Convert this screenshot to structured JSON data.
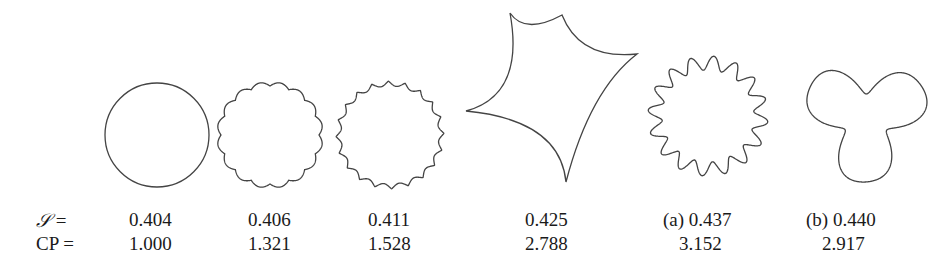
{
  "figure": {
    "row_labels": {
      "s": "S =",
      "cp": "CP ="
    },
    "shapes": [
      {
        "id": "circle",
        "tag": "",
        "s": "0.404",
        "cp": "1.000"
      },
      {
        "id": "scalloped-16",
        "tag": "",
        "s": "0.406",
        "cp": "1.321"
      },
      {
        "id": "cusped-20",
        "tag": "",
        "s": "0.411",
        "cp": "1.528"
      },
      {
        "id": "astroid-4",
        "tag": "",
        "s": "0.425",
        "cp": "2.788"
      },
      {
        "id": "wavy-16",
        "tag": "(a)",
        "s": "0.437",
        "cp": "3.152"
      },
      {
        "id": "trefoil",
        "tag": "(b)",
        "s": "0.440",
        "cp": "2.917"
      }
    ],
    "labels_display": {
      "s": [
        "0.404",
        "0.406",
        "0.411",
        "0.425",
        "(a) 0.437",
        "(b) 0.440"
      ],
      "cp": [
        "1.000",
        "1.321",
        "1.528",
        "2.788",
        "3.152",
        "2.917"
      ]
    }
  }
}
